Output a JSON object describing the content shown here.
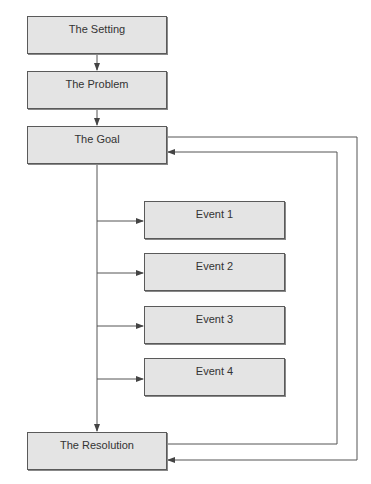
{
  "diagram": {
    "type": "flowchart",
    "colors": {
      "box_fill": "#e4e4e4",
      "box_border": "#5a5a5a",
      "line": "#555555",
      "text": "#333333"
    },
    "main_boxes": [
      {
        "id": "setting",
        "label": "The Setting"
      },
      {
        "id": "problem",
        "label": "The Problem"
      },
      {
        "id": "goal",
        "label": "The Goal"
      },
      {
        "id": "resolution",
        "label": "The Resolution"
      }
    ],
    "events": [
      {
        "id": "event1",
        "label": "Event 1"
      },
      {
        "id": "event2",
        "label": "Event 2"
      },
      {
        "id": "event3",
        "label": "Event 3"
      },
      {
        "id": "event4",
        "label": "Event 4"
      }
    ],
    "edges": [
      {
        "from": "setting",
        "to": "problem"
      },
      {
        "from": "problem",
        "to": "goal"
      },
      {
        "from": "goal",
        "to": "event1"
      },
      {
        "from": "goal",
        "to": "event2"
      },
      {
        "from": "goal",
        "to": "event3"
      },
      {
        "from": "goal",
        "to": "event4"
      },
      {
        "from": "goal",
        "to": "resolution"
      },
      {
        "from": "goal",
        "to": "resolution",
        "route": "outer-right-loop"
      },
      {
        "from": "resolution",
        "to": "goal",
        "route": "inner-right-loop"
      }
    ]
  }
}
